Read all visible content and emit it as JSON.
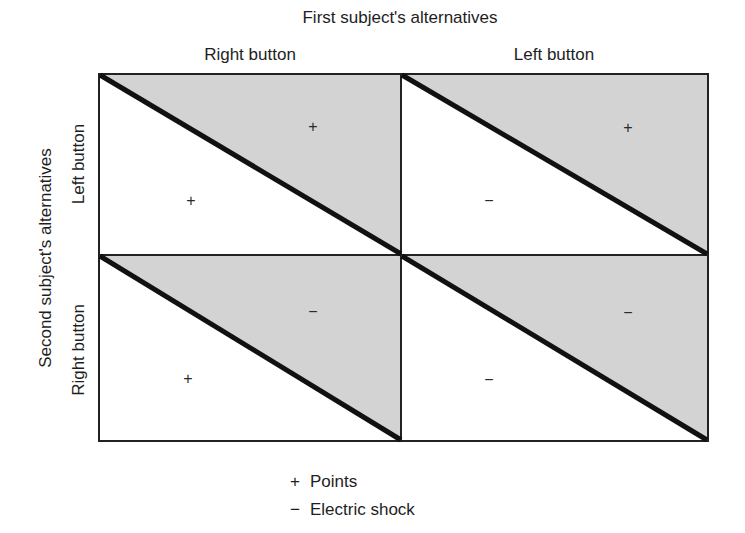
{
  "title": "First subject's alternatives",
  "columns": [
    {
      "label": "Right button"
    },
    {
      "label": "Left button"
    }
  ],
  "row_axis_label": "Second subject's alternatives",
  "rows": [
    {
      "label": "Left button"
    },
    {
      "label": "Right button"
    }
  ],
  "cells": [
    {
      "row": "Left button",
      "col": "Right button",
      "upper_shaded": "+",
      "lower_white": "+"
    },
    {
      "row": "Left button",
      "col": "Left button",
      "upper_shaded": "+",
      "lower_white": "−"
    },
    {
      "row": "Right button",
      "col": "Right button",
      "upper_shaded": "−",
      "lower_white": "+"
    },
    {
      "row": "Right button",
      "col": "Left button",
      "upper_shaded": "−",
      "lower_white": "−"
    }
  ],
  "legend": [
    {
      "symbol": "+",
      "label": "Points"
    },
    {
      "symbol": "−",
      "label": "Electric shock"
    }
  ],
  "colors": {
    "shade": "#d3d3d3",
    "line": "#111111",
    "border": "#222222"
  }
}
